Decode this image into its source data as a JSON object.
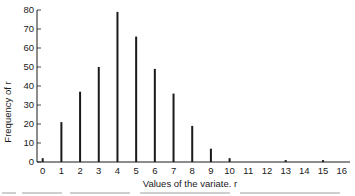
{
  "chart_data": {
    "type": "bar",
    "style": "spike (line) bar chart",
    "title": "",
    "xlabel": "Values of the variate. r",
    "ylabel": "Frequency of r",
    "categories": [
      "0",
      "1",
      "2",
      "3",
      "4",
      "5",
      "6",
      "7",
      "8",
      "9",
      "10",
      "11",
      "12",
      "13",
      "14",
      "15",
      "16"
    ],
    "x": [
      0,
      1,
      2,
      3,
      4,
      5,
      6,
      7,
      8,
      9,
      10,
      11,
      12,
      13,
      14,
      15,
      16
    ],
    "values": [
      2,
      21,
      37,
      50,
      79,
      66,
      49,
      36,
      19,
      7,
      2,
      0,
      0,
      1,
      0,
      1,
      0
    ],
    "xlim": [
      0,
      16
    ],
    "ylim": [
      0,
      80
    ],
    "yticks": [
      0,
      10,
      20,
      30,
      40,
      50,
      60,
      70,
      80
    ],
    "xticks": [
      0,
      1,
      2,
      3,
      4,
      5,
      6,
      7,
      8,
      9,
      10,
      11,
      12,
      13,
      14,
      15,
      16
    ],
    "grid": false,
    "legend": null,
    "bar_color": "#1a1a1a"
  },
  "axes": {
    "x_title": "Values of the variate. r",
    "y_title": "Frequency of r",
    "y_tick_labels": [
      "0",
      "10",
      "20",
      "30",
      "40",
      "50",
      "60",
      "70",
      "80"
    ],
    "x_tick_labels": [
      "0",
      "1",
      "2",
      "3",
      "4",
      "5",
      "6",
      "7",
      "8",
      "9",
      "10",
      "11",
      "12",
      "13",
      "14",
      "15",
      "16"
    ]
  }
}
